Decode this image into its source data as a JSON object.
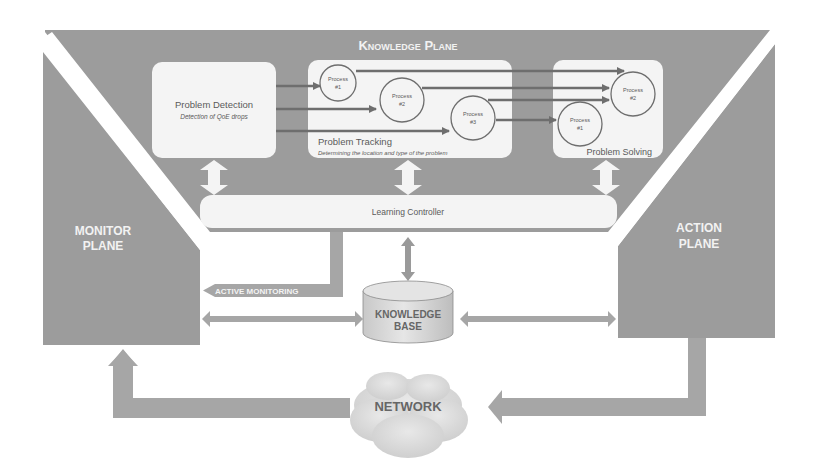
{
  "colors": {
    "plane_fill": "#9c9c9c",
    "box_fill": "#f4f4f4",
    "arrow_dark": "#6e6e6e",
    "arrow_light": "#f7f7f7",
    "connector": "#a6a6a6",
    "text_dark": "#555555",
    "text_light": "#f2f2f2",
    "cylinder": "#d8d8d8",
    "cloud": "#dcdcdc"
  },
  "knowledge_plane": {
    "title": "Knowledge Plane",
    "problem_detection": {
      "title": "Problem Detection",
      "subtitle": "Detection of QoE drops"
    },
    "problem_tracking": {
      "title": "Problem Tracking",
      "subtitle": "Determining  the location and type of the problem",
      "processes": [
        {
          "line1": "Process",
          "line2": "#1"
        },
        {
          "line1": "Process",
          "line2": "#2"
        },
        {
          "line1": "Process",
          "line2": "#3"
        }
      ]
    },
    "problem_solving": {
      "title": "Problem Solving",
      "processes": [
        {
          "line1": "Process",
          "line2": "#1"
        },
        {
          "line1": "Process",
          "line2": "#2"
        }
      ]
    },
    "learning_controller": "Learning Controller"
  },
  "monitor_plane": {
    "line1": "MONITOR",
    "line2": "PLANE"
  },
  "action_plane": {
    "line1": "ACTION",
    "line2": "PLANE"
  },
  "active_monitoring": "ACTIVE MONITORING",
  "knowledge_base": {
    "line1": "KNOWLEDGE",
    "line2": "BASE"
  },
  "network": "NETWORK"
}
